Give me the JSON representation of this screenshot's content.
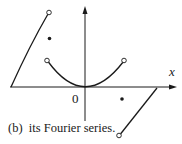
{
  "figure": {
    "caption": "(b)  its Fourier series.",
    "axis_x_label": "x",
    "origin_label": "0",
    "colors": {
      "stroke": "#1a1a1a",
      "background": "#ffffff"
    }
  }
}
